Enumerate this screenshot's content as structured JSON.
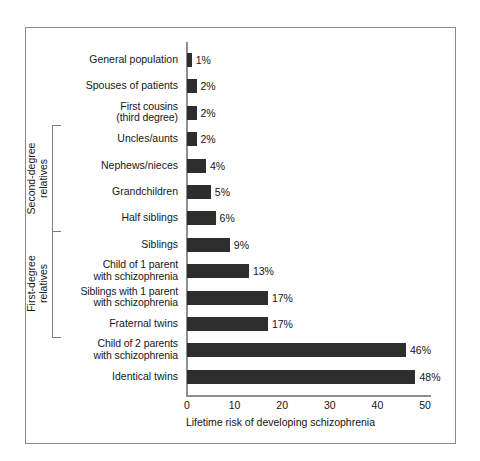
{
  "chart_data": {
    "type": "bar",
    "orientation": "horizontal",
    "title": "",
    "xlabel": "Lifetime risk of developing schizophrenia",
    "ylabel": "",
    "xlim": [
      0,
      50
    ],
    "xticks": [
      0,
      10,
      20,
      30,
      40,
      50
    ],
    "grid": false,
    "legend": null,
    "bar_color": "#2e2e2e",
    "categories": [
      "General population",
      "Spouses of patients",
      "First cousins\n(third degree)",
      "Uncles/aunts",
      "Nephews/nieces",
      "Grandchildren",
      "Half siblings",
      "Siblings",
      "Child of 1 parent\nwith schizophrenia",
      "Siblings with 1 parent\nwith schizophrenia",
      "Fraternal twins",
      "Child of 2 parents\nwith schizophrenia",
      "Identical twins"
    ],
    "values": [
      1,
      2,
      2,
      2,
      4,
      5,
      6,
      9,
      13,
      17,
      17,
      46,
      48
    ],
    "value_labels": [
      "1%",
      "2%",
      "2%",
      "2%",
      "4%",
      "5%",
      "6%",
      "9%",
      "13%",
      "17%",
      "17%",
      "46%",
      "48%"
    ],
    "groups": [
      {
        "label": "Second-degree\nrelatives",
        "from_index": 3,
        "to_index": 6
      },
      {
        "label": "First-degree\nrelatives",
        "from_index": 7,
        "to_index": 10
      }
    ]
  }
}
